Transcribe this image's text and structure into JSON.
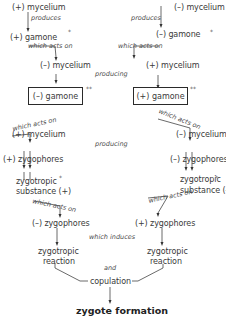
{
  "left": {
    "mycelium_top": "(+) mycelium",
    "produces": "produces",
    "gamone": "(+) gamone",
    "gamone_mark": "*",
    "which_acts_on_1": "which acts on",
    "mycelium_2": "(–) mycelium",
    "box_gamone": "(–) gamone",
    "box_mark": "**",
    "which_acts_on_2": "which acts on",
    "mycelium_3": "(+) mycelium",
    "zygophores": "(+) zygophores",
    "substance_line1": "zygotropic",
    "substance_line2": "substance (+)",
    "substance_mark": "*",
    "which_acts_on_3": "which acts on",
    "zygophores_2": "(–) zygophores",
    "reaction_line1": "zygotropic",
    "reaction_line2": "reaction"
  },
  "right": {
    "mycelium_top": "(–) mycelium",
    "produces": "produces",
    "gamone": "(–) gamone",
    "gamone_mark": "*",
    "which_acts_on_1": "which acts on",
    "mycelium_2": "(+) mycelium",
    "box_gamone": "(+) gamone",
    "box_mark": "**",
    "which_acts_on_2": "which acts on",
    "mycelium_3": "(–) mycelium",
    "zygophores": "(–) zygophores",
    "substance_line1": "zygotropic",
    "substance_line2": "substance (–)",
    "substance_mark": "*",
    "which_acts_on_3": "which acts on",
    "zygophores_2": "(+) zygophores",
    "reaction_line1": "zygotropic",
    "reaction_line2": "reaction"
  },
  "center": {
    "producing_1": "producing",
    "producing_2": "producing",
    "which_induces": "which induces",
    "and": "and",
    "copulation": "copulation",
    "result": "zygote formation"
  }
}
